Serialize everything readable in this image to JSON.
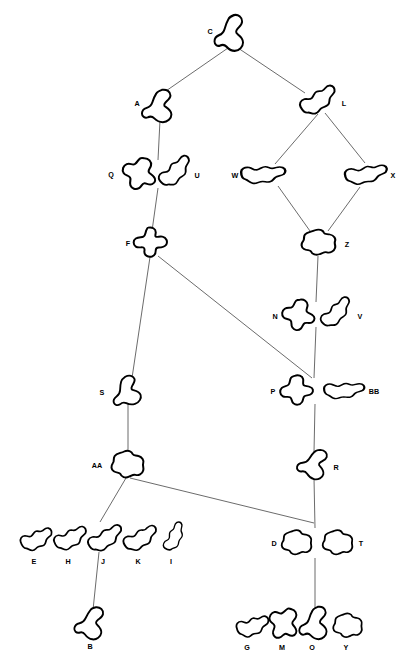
{
  "diagram": {
    "background_color": "#ffffff",
    "node_stroke_color": "#000000",
    "node_fill_color": "#ffffff",
    "edge_color": "#5a5a5a",
    "label_color": "#000000",
    "width": 416,
    "height": 668,
    "nodes": [
      {
        "id": "C",
        "label": "C",
        "x": 232,
        "y": 33,
        "lx": 210,
        "ly": 32,
        "shape": "blob-s-vert",
        "sx": 0.92,
        "sy": 1.05,
        "rot": 0
      },
      {
        "id": "A",
        "label": "A",
        "x": 160,
        "y": 106,
        "lx": 137,
        "ly": 104,
        "shape": "blob-s-vert",
        "sx": 0.95,
        "sy": 0.95,
        "rot": 0
      },
      {
        "id": "L",
        "label": "L",
        "x": 319,
        "y": 101,
        "lx": 344,
        "ly": 104,
        "shape": "blob-wiggle",
        "sx": 1.0,
        "sy": 0.85,
        "rot": -28
      },
      {
        "id": "Q",
        "label": "Q",
        "x": 141,
        "y": 174,
        "lx": 111,
        "ly": 175,
        "shape": "blob-lumpy",
        "sx": 1.0,
        "sy": 0.95,
        "rot": 12
      },
      {
        "id": "U",
        "label": "U",
        "x": 176,
        "y": 172,
        "lx": 197,
        "ly": 176,
        "shape": "blob-wiggle",
        "sx": 0.95,
        "sy": 0.8,
        "rot": -38
      },
      {
        "id": "W",
        "label": "W",
        "x": 263,
        "y": 175,
        "lx": 235,
        "ly": 176,
        "shape": "blob-wiggle",
        "sx": 1.15,
        "sy": 0.75,
        "rot": 0
      },
      {
        "id": "X",
        "label": "X",
        "x": 366,
        "y": 175,
        "lx": 393,
        "ly": 176,
        "shape": "blob-wiggle",
        "sx": 1.1,
        "sy": 0.75,
        "rot": -6
      },
      {
        "id": "F",
        "label": "F",
        "x": 151,
        "y": 243,
        "lx": 128,
        "ly": 244,
        "shape": "blob-cross",
        "sx": 0.95,
        "sy": 0.9,
        "rot": 0
      },
      {
        "id": "Z",
        "label": "Z",
        "x": 319,
        "y": 243,
        "lx": 347,
        "ly": 245,
        "shape": "blob-cloud",
        "sx": 1.0,
        "sy": 0.85,
        "rot": 0
      },
      {
        "id": "N",
        "label": "N",
        "x": 300,
        "y": 315,
        "lx": 275,
        "ly": 317,
        "shape": "blob-lumpy",
        "sx": 0.95,
        "sy": 0.9,
        "rot": 0
      },
      {
        "id": "V",
        "label": "V",
        "x": 337,
        "y": 313,
        "lx": 360,
        "ly": 317,
        "shape": "blob-wiggle",
        "sx": 0.92,
        "sy": 0.75,
        "rot": -40
      },
      {
        "id": "S",
        "label": "S",
        "x": 128,
        "y": 391,
        "lx": 102,
        "ly": 393,
        "shape": "blob-s-vert",
        "sx": 0.9,
        "sy": 0.85,
        "rot": -18
      },
      {
        "id": "P",
        "label": "P",
        "x": 298,
        "y": 390,
        "lx": 273,
        "ly": 392,
        "shape": "blob-lumpy",
        "sx": 0.95,
        "sy": 0.85,
        "rot": -14
      },
      {
        "id": "BB",
        "label": "BB",
        "x": 344,
        "y": 391,
        "lx": 374,
        "ly": 392,
        "shape": "blob-wiggle",
        "sx": 1.05,
        "sy": 0.68,
        "rot": 0
      },
      {
        "id": "AA",
        "label": "AA",
        "x": 128,
        "y": 465,
        "lx": 97,
        "ly": 466,
        "shape": "blob-cloud",
        "sx": 0.95,
        "sy": 0.9,
        "rot": 0
      },
      {
        "id": "R",
        "label": "R",
        "x": 315,
        "y": 464,
        "lx": 336,
        "ly": 468,
        "shape": "blob-s-vert",
        "sx": 0.88,
        "sy": 0.88,
        "rot": 14
      },
      {
        "id": "E",
        "label": "E",
        "x": 37,
        "y": 540,
        "lx": 34,
        "ly": 562,
        "shape": "blob-wiggle",
        "sx": 0.85,
        "sy": 0.78,
        "rot": -18
      },
      {
        "id": "H",
        "label": "H",
        "x": 71,
        "y": 539,
        "lx": 68,
        "ly": 562,
        "shape": "blob-wiggle",
        "sx": 0.88,
        "sy": 0.78,
        "rot": -20
      },
      {
        "id": "J",
        "label": "J",
        "x": 106,
        "y": 539,
        "lx": 103,
        "ly": 562,
        "shape": "blob-wiggle",
        "sx": 0.95,
        "sy": 0.78,
        "rot": -26
      },
      {
        "id": "K",
        "label": "K",
        "x": 141,
        "y": 539,
        "lx": 138,
        "ly": 562,
        "shape": "blob-wiggle",
        "sx": 0.92,
        "sy": 0.78,
        "rot": -24
      },
      {
        "id": "I",
        "label": "I",
        "x": 175,
        "y": 537,
        "lx": 171,
        "ly": 562,
        "shape": "blob-wiggle",
        "sx": 0.78,
        "sy": 0.62,
        "rot": -58
      },
      {
        "id": "D",
        "label": "D",
        "x": 297,
        "y": 543,
        "lx": 274,
        "ly": 544,
        "shape": "blob-cloud",
        "sx": 0.88,
        "sy": 0.82,
        "rot": 0
      },
      {
        "id": "T",
        "label": "T",
        "x": 338,
        "y": 543,
        "lx": 361,
        "ly": 544,
        "shape": "blob-cloud",
        "sx": 0.88,
        "sy": 0.82,
        "rot": 0
      },
      {
        "id": "B",
        "label": "B",
        "x": 92,
        "y": 623,
        "lx": 90,
        "ly": 647,
        "shape": "blob-s-vert",
        "sx": 0.88,
        "sy": 0.95,
        "rot": 8
      },
      {
        "id": "G",
        "label": "G",
        "x": 253,
        "y": 627,
        "lx": 247,
        "ly": 648,
        "shape": "blob-wiggle",
        "sx": 0.85,
        "sy": 0.78,
        "rot": -12
      },
      {
        "id": "M",
        "label": "M",
        "x": 285,
        "y": 624,
        "lx": 282,
        "ly": 648,
        "shape": "blob-lumpy",
        "sx": 0.9,
        "sy": 0.95,
        "rot": 24
      },
      {
        "id": "O",
        "label": "O",
        "x": 316,
        "y": 623,
        "lx": 312,
        "ly": 648,
        "shape": "blob-s-vert",
        "sx": 0.88,
        "sy": 0.95,
        "rot": 0
      },
      {
        "id": "Y",
        "label": "Y",
        "x": 348,
        "y": 626,
        "lx": 346,
        "ly": 648,
        "shape": "blob-cloud",
        "sx": 0.85,
        "sy": 0.8,
        "rot": 0
      }
    ],
    "edges": [
      {
        "from": "C",
        "to": "A",
        "x1": 228,
        "y1": 48,
        "x2": 163,
        "y2": 93
      },
      {
        "from": "C",
        "to": "L",
        "x1": 238,
        "y1": 48,
        "x2": 305,
        "y2": 93
      },
      {
        "from": "A",
        "to": "Q",
        "x1": 160,
        "y1": 120,
        "x2": 158,
        "y2": 160
      },
      {
        "from": "L",
        "to": "W",
        "x1": 318,
        "y1": 114,
        "x2": 275,
        "y2": 164
      },
      {
        "from": "L",
        "to": "X",
        "x1": 325,
        "y1": 113,
        "x2": 365,
        "y2": 163
      },
      {
        "from": "Q",
        "to": "F",
        "x1": 158,
        "y1": 188,
        "x2": 152,
        "y2": 231
      },
      {
        "from": "W",
        "to": "Z",
        "x1": 278,
        "y1": 186,
        "x2": 310,
        "y2": 231
      },
      {
        "from": "X",
        "to": "Z",
        "x1": 360,
        "y1": 187,
        "x2": 328,
        "y2": 231
      },
      {
        "from": "Z",
        "to": "N",
        "x1": 318,
        "y1": 256,
        "x2": 316,
        "y2": 302
      },
      {
        "from": "F",
        "to": "S",
        "x1": 150,
        "y1": 257,
        "x2": 132,
        "y2": 378
      },
      {
        "from": "F",
        "to": "P",
        "x1": 158,
        "y1": 256,
        "x2": 312,
        "y2": 378
      },
      {
        "from": "N",
        "to": "P",
        "x1": 316,
        "y1": 327,
        "x2": 314,
        "y2": 378
      },
      {
        "from": "S",
        "to": "AA",
        "x1": 128,
        "y1": 404,
        "x2": 128,
        "y2": 452
      },
      {
        "from": "P",
        "to": "R",
        "x1": 315,
        "y1": 404,
        "x2": 314,
        "y2": 452
      },
      {
        "from": "AA",
        "to": "J",
        "x1": 126,
        "y1": 478,
        "x2": 100,
        "y2": 522
      },
      {
        "from": "AA",
        "to": "D",
        "x1": 130,
        "y1": 478,
        "x2": 314,
        "y2": 523
      },
      {
        "from": "R",
        "to": "D",
        "x1": 314,
        "y1": 478,
        "x2": 315,
        "y2": 528
      },
      {
        "from": "J",
        "to": "B",
        "x1": 99,
        "y1": 552,
        "x2": 93,
        "y2": 610
      },
      {
        "from": "D",
        "to": "O",
        "x1": 315,
        "y1": 558,
        "x2": 315,
        "y2": 610
      }
    ]
  }
}
